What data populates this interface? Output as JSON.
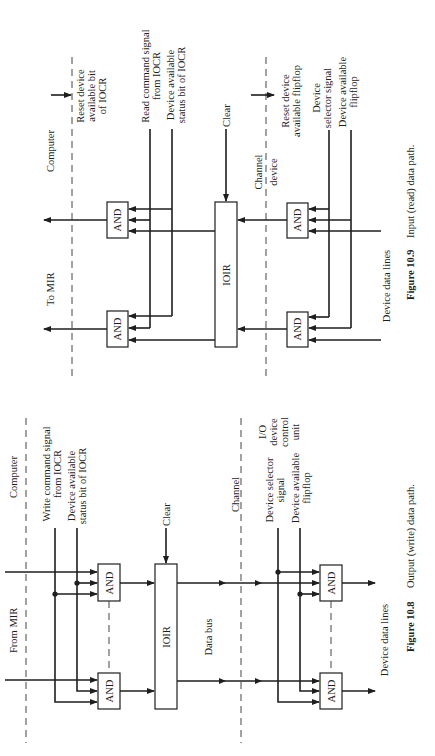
{
  "figure_10_9": {
    "caption_number": "Figure 10.9",
    "caption_text": "Input (read) data path.",
    "zones": {
      "computer": "Computer",
      "channel_device_top": "Channel",
      "channel_device_bottom": "device"
    },
    "labels": {
      "reset_bit_1": "Reset device",
      "reset_bit_2": "available bit",
      "reset_bit_3": "of IOCR",
      "read_cmd_1": "Read command signal",
      "read_cmd_2": "from IOCR",
      "dev_status_1": "Device available",
      "dev_status_2": "status bit of IOCR",
      "clear": "Clear",
      "reset_ff_1": "Reset device",
      "reset_ff_2": "available flipflop",
      "dev_sel_1": "Device",
      "dev_sel_2": "selector signal",
      "dev_avail_1": "Device available",
      "dev_avail_2": "flipflop",
      "to_mir": "To MIR",
      "ioir": "IOIR",
      "and_gate": "AND",
      "device_data_lines": "Device data lines"
    }
  },
  "figure_10_8": {
    "caption_number": "Figure 10.8",
    "caption_text": "Output (write) data path.",
    "zones": {
      "computer": "Computer",
      "channel": "Channel",
      "io_unit_1": "I/O",
      "io_unit_2": "device",
      "io_unit_3": "control",
      "io_unit_4": "unit"
    },
    "labels": {
      "write_cmd_1": "Write command signal",
      "write_cmd_2": "from IOCR",
      "dev_status_1": "Device available",
      "dev_status_2": "status bit of IOCR",
      "clear": "Clear",
      "dev_sel_1": "Device selector",
      "dev_sel_2": "signal",
      "dev_avail_1": "Device available",
      "dev_avail_2": "flipflop",
      "from_mir": "From MIR",
      "ioir": "IOIR",
      "data_bus": "Data bus",
      "and_gate": "AND",
      "device_data_lines": "Device data lines"
    }
  }
}
